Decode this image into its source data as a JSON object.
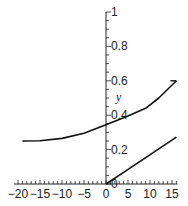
{
  "chart_data": {
    "type": "line",
    "title": "",
    "xlabel": "",
    "ylabel": "y",
    "xlim": [
      -20,
      16
    ],
    "ylim": [
      0,
      1
    ],
    "x_ticks": [
      -20,
      -15,
      -10,
      -5,
      0,
      5,
      10,
      15
    ],
    "x_tick_labels": [
      "-20",
      "-15",
      "-10",
      "-5",
      "0",
      "5",
      "10",
      "15"
    ],
    "y_ticks": [
      0,
      0.2,
      0.4,
      0.6,
      0.8,
      1
    ],
    "y_tick_labels": [
      "0",
      "0.2",
      "0.4",
      "0.6",
      "0.8",
      "1"
    ],
    "grid": false,
    "legend": null,
    "series": [
      {
        "name": "upper-curve",
        "x": [
          -19,
          -15,
          -10,
          -5,
          0,
          5,
          9,
          12,
          16
        ],
        "y": [
          0.25,
          0.252,
          0.265,
          0.295,
          0.345,
          0.395,
          0.44,
          0.5,
          0.6
        ]
      },
      {
        "name": "lower-line",
        "x": [
          0,
          4,
          8,
          12,
          16
        ],
        "y": [
          0,
          0.068,
          0.136,
          0.204,
          0.272
        ]
      }
    ],
    "colors": {
      "line": "#111111",
      "axis": "#222222",
      "background": "#ffffff"
    }
  }
}
